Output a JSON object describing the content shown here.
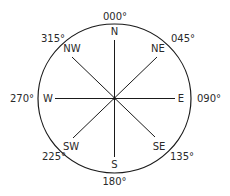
{
  "diagram": {
    "type": "compass-rose",
    "center": [
      114.5,
      98.5
    ],
    "radius": [
      76.5,
      74.5
    ],
    "colors": {
      "stroke": "#1a1a1a",
      "text": "#2a2a2a",
      "background": "#ffffff"
    },
    "directions": [
      {
        "label": "N",
        "bearing": "000°"
      },
      {
        "label": "NE",
        "bearing": "045°"
      },
      {
        "label": "E",
        "bearing": "090°"
      },
      {
        "label": "SE",
        "bearing": "135°"
      },
      {
        "label": "S",
        "bearing": "180°"
      },
      {
        "label": "SW",
        "bearing": "225°"
      },
      {
        "label": "W",
        "bearing": "270°"
      },
      {
        "label": "NW",
        "bearing": "315°"
      }
    ]
  }
}
